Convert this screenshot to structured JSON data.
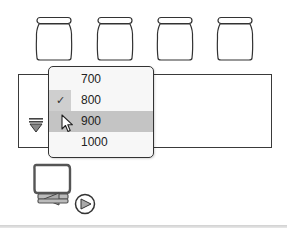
{
  "jars": [
    {
      "id": "jar-1",
      "x": 34
    },
    {
      "id": "jar-2",
      "x": 95
    },
    {
      "id": "jar-3",
      "x": 155
    },
    {
      "id": "jar-4",
      "x": 215
    }
  ],
  "panel": {
    "filter_icon": "filter-triangle-icon"
  },
  "dropdown": {
    "items": [
      {
        "label": "700",
        "checked": false,
        "hover": false
      },
      {
        "label": "800",
        "checked": true,
        "hover": false
      },
      {
        "label": "900",
        "checked": false,
        "hover": true
      },
      {
        "label": "1000",
        "checked": false,
        "hover": false
      }
    ],
    "check_glyph": "✓",
    "selected_value": "800"
  },
  "device": {
    "icons": [
      "monitor-frame-icon",
      "rewind-arrow-icon",
      "play-circle-icon"
    ]
  },
  "colors": {
    "outline": "#333333",
    "menu_bg": "#f7f7f7",
    "hover_bg": "#c4c4c4",
    "checked_bg": "#cfcfcf"
  }
}
